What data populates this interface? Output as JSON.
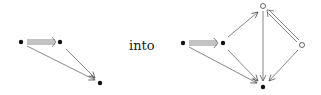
{
  "connector_text": "into",
  "left_diagram": {
    "nodes": [
      {
        "id": "a",
        "type": "filled",
        "x": 21,
        "y": 42
      },
      {
        "id": "b",
        "type": "filled",
        "x": 60,
        "y": 42
      },
      {
        "id": "c",
        "type": "filled",
        "x": 100,
        "y": 83
      }
    ],
    "edges": [
      {
        "from": "a",
        "to": "b",
        "style": "triple"
      },
      {
        "from": "a",
        "to": "c",
        "style": "single"
      },
      {
        "from": "b",
        "to": "c",
        "style": "single"
      }
    ]
  },
  "right_diagram": {
    "nodes": [
      {
        "id": "a",
        "type": "filled",
        "x": 183,
        "y": 43
      },
      {
        "id": "b",
        "type": "filled",
        "x": 223,
        "y": 43
      },
      {
        "id": "t",
        "type": "hollow",
        "x": 263,
        "y": 6
      },
      {
        "id": "r",
        "type": "hollow",
        "x": 302,
        "y": 45
      },
      {
        "id": "c",
        "type": "filled",
        "x": 263,
        "y": 87
      }
    ],
    "edges": [
      {
        "from": "a",
        "to": "b",
        "style": "triple"
      },
      {
        "from": "a",
        "to": "c",
        "style": "single"
      },
      {
        "from": "b",
        "to": "c",
        "style": "single"
      },
      {
        "from": "b",
        "to": "t",
        "style": "single"
      },
      {
        "from": "t",
        "to": "c",
        "style": "single"
      },
      {
        "from": "r",
        "to": "t",
        "style": "double"
      },
      {
        "from": "r",
        "to": "c",
        "style": "single"
      }
    ]
  }
}
